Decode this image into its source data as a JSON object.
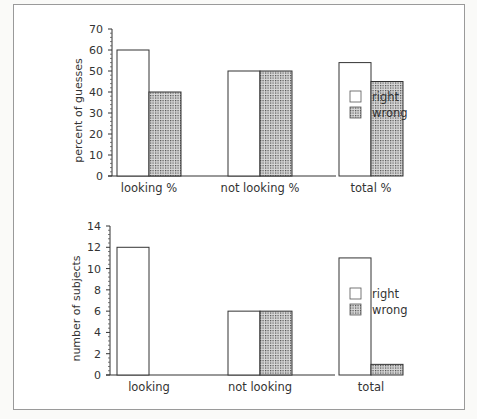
{
  "chart_data": [
    {
      "type": "bar",
      "title": "",
      "xlabel": "",
      "ylabel": "percent of guesses",
      "ylim": [
        0,
        70
      ],
      "yticks": [
        0,
        10,
        20,
        30,
        40,
        50,
        60,
        70
      ],
      "categories": [
        "looking %",
        "not looking %",
        "total %"
      ],
      "series": [
        {
          "name": "right",
          "values": [
            60,
            50,
            54
          ]
        },
        {
          "name": "wrong",
          "values": [
            40,
            50,
            45
          ]
        }
      ],
      "legend_position": "right",
      "grid": false
    },
    {
      "type": "bar",
      "title": "",
      "xlabel": "",
      "ylabel": "number of subjects",
      "ylim": [
        0,
        14
      ],
      "yticks": [
        0,
        2,
        4,
        6,
        8,
        10,
        12,
        14
      ],
      "categories": [
        "looking",
        "not looking",
        "total"
      ],
      "series": [
        {
          "name": "right",
          "values": [
            12,
            6,
            11
          ]
        },
        {
          "name": "wrong",
          "values": [
            0,
            6,
            1
          ]
        }
      ],
      "legend_position": "right",
      "grid": false
    }
  ],
  "colors": {
    "right": "#ffffff",
    "wrong_dots": "#555555",
    "stroke": "#333333"
  }
}
